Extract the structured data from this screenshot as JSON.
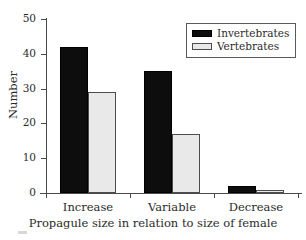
{
  "chart_data": {
    "type": "bar",
    "title": "",
    "subtitle": "",
    "xlabel": "Propagule size in relation to size of female",
    "ylabel": "Number",
    "categories": [
      "Increase",
      "Variable",
      "Decrease"
    ],
    "series": [
      {
        "name": "Invertebrates",
        "values": [
          42,
          35,
          2
        ],
        "color": "#0d0d0d"
      },
      {
        "name": "Vertebrates",
        "values": [
          29,
          17,
          1
        ],
        "color": "#e9e9e9"
      }
    ],
    "ylim": [
      0,
      50
    ],
    "yticks": [
      0,
      10,
      20,
      30,
      40,
      50
    ],
    "ytick_labels": [
      "0",
      "10",
      "20",
      "30",
      "40",
      "50"
    ],
    "grid": false,
    "legend_position": "top-right",
    "legend_entries": [
      "Invertebrates",
      "Vertebrates"
    ],
    "annotations": []
  },
  "axes": {
    "y_label": "Number",
    "x_label": "Propagule size in relation to size of female",
    "y_ticks": [
      "0",
      "10",
      "20",
      "30",
      "40",
      "50"
    ],
    "x_ticks": [
      "Increase",
      "Variable",
      "Decrease"
    ]
  },
  "legend": {
    "items": [
      {
        "label": "Invertebrates",
        "swatch": "black-filled-swatch"
      },
      {
        "label": "Vertebrates",
        "swatch": "light-gray-swatch"
      }
    ]
  }
}
